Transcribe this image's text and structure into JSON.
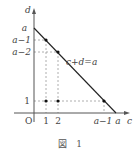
{
  "diagram": {
    "axes": {
      "x_label": "c",
      "y_label": "d",
      "origin_label": "O"
    },
    "x_ticks": [
      "1",
      "2",
      "a−1",
      "a"
    ],
    "y_ticks": [
      "a",
      "a−1",
      "a−2",
      "1"
    ],
    "line_label": "c+d=a",
    "points": [
      {
        "c": "1",
        "d": "a−1"
      },
      {
        "c": "2",
        "d": "a−2"
      },
      {
        "c": "1",
        "d": "1"
      },
      {
        "c": "2",
        "d": "1"
      },
      {
        "c": "a−1",
        "d": "1"
      }
    ],
    "caption": "図　1"
  },
  "colors": {
    "axis": "#555555",
    "line": "#222222",
    "dashed": "#888888",
    "point": "#111111"
  }
}
